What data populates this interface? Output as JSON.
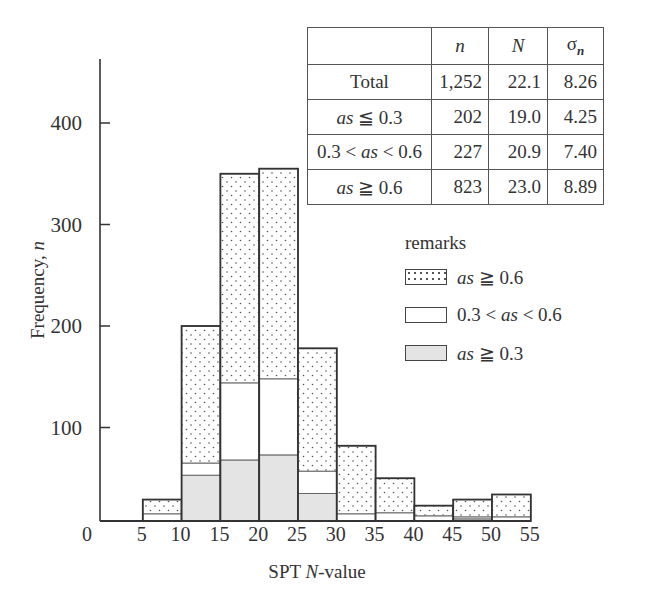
{
  "chart_data": {
    "type": "bar",
    "stacked": true,
    "title": "",
    "xlabel": "SPT N-value",
    "ylabel": "Frequency, n",
    "x_ticks": [
      "0",
      "5",
      "10",
      "15",
      "20",
      "25",
      "30",
      "35",
      "40",
      "45",
      "50",
      "55"
    ],
    "y_ticks": [
      "100",
      "200",
      "300",
      "400"
    ],
    "ylim": [
      0,
      460
    ],
    "xlim": [
      0,
      55
    ],
    "grid": false,
    "bins": [
      "5-10",
      "10-15",
      "15-20",
      "20-25",
      "25-30",
      "30-35",
      "35-40",
      "40-45",
      "45-50",
      "50-55"
    ],
    "bin_edges": [
      5,
      10,
      15,
      20,
      25,
      30,
      35,
      40,
      45,
      50,
      55
    ],
    "series": [
      {
        "name": "as ≦ 0.3",
        "fill": "gray",
        "values": [
          0,
          53,
          68,
          73,
          35,
          0,
          0,
          0,
          10,
          0
        ]
      },
      {
        "name": "0.3 < as < 0.6",
        "fill": "white",
        "values": [
          15,
          12,
          76,
          75,
          22,
          15,
          16,
          13,
          2,
          12
        ]
      },
      {
        "name": "as ≧ 0.6",
        "fill": "dotted",
        "values": [
          14,
          135,
          206,
          207,
          121,
          67,
          34,
          10,
          17,
          22
        ]
      }
    ],
    "totals": [
      29,
      200,
      350,
      355,
      178,
      82,
      50,
      23,
      29,
      34
    ],
    "legend": {
      "title": "remarks",
      "position": "center-right"
    },
    "annotations": {
      "table": {
        "headers": [
          "",
          "n",
          "N",
          "σn"
        ],
        "rows": [
          [
            "Total",
            "1,252",
            "22.1",
            "8.26"
          ],
          [
            "as ≦ 0.3",
            "202",
            "19.0",
            "4.25"
          ],
          [
            "0.3 < as < 0.6",
            "227",
            "20.9",
            "7.40"
          ],
          [
            "as ≧ 0.6",
            "823",
            "23.0",
            "8.89"
          ]
        ]
      }
    }
  },
  "axes": {
    "xlabel_main": "SPT ",
    "xlabel_italic": "N",
    "xlabel_rest": "-value",
    "ylabel_main": "Frequency, ",
    "ylabel_italic": "n"
  },
  "table": {
    "header": {
      "n": "n",
      "N": "N",
      "sigma": "σ",
      "sigma_sub": "n"
    },
    "rows": [
      {
        "label_pre": "",
        "label_it": "",
        "label_post": "Total",
        "n": "1,252",
        "N": "22.1",
        "sigma": "8.26"
      },
      {
        "label_pre": "",
        "label_it": "as",
        "label_post": " ≦ 0.3",
        "n": "202",
        "N": "19.0",
        "sigma": "4.25"
      },
      {
        "label_pre": "0.3 < ",
        "label_it": "as",
        "label_post": " < 0.6",
        "n": "227",
        "N": "20.9",
        "sigma": "7.40"
      },
      {
        "label_pre": "",
        "label_it": "as",
        "label_post": " ≧ 0.6",
        "n": "823",
        "N": "23.0",
        "sigma": "8.89"
      }
    ]
  },
  "legend": {
    "title": "remarks",
    "items": [
      {
        "pre": "",
        "it": "as",
        "post": " ≧ 0.6",
        "swatch": "dots"
      },
      {
        "pre": "0.3 < ",
        "it": "as",
        "post": " < 0.6",
        "swatch": "white"
      },
      {
        "pre": "",
        "it": "as",
        "post": " ≧ 0.3",
        "swatch": "gray"
      }
    ]
  },
  "colors": {
    "gray_fill": "#e4e4e4",
    "outline": "#444444",
    "dot": "#555555"
  }
}
